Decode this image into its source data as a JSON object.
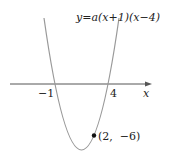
{
  "diagram": {
    "equation": "y=a(x+1)(x−4)",
    "x_axis_label": "x",
    "roots": [
      {
        "value": -1,
        "label": "−1"
      },
      {
        "value": 4,
        "label": "4"
      }
    ],
    "point": {
      "x": 2,
      "y": -6,
      "label": "(2,  −6)"
    },
    "colors": {
      "curve": "#999999",
      "axis": "#555555",
      "text": "#222222"
    }
  }
}
